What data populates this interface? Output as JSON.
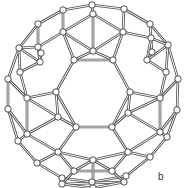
{
  "figure": {
    "label": "b",
    "colors": {
      "bond": "#4a4a4a",
      "atom_fill": "#ffffff",
      "atom_stroke": "#3a3a3a"
    }
  },
  "nodes": [
    [
      92,
      5
    ],
    [
      124,
      9
    ],
    [
      150,
      24
    ],
    [
      168,
      45
    ],
    [
      178,
      79
    ],
    [
      177,
      110
    ],
    [
      167,
      137
    ],
    [
      150,
      157
    ],
    [
      126,
      176
    ],
    [
      92,
      182
    ],
    [
      62,
      178
    ],
    [
      37,
      163
    ],
    [
      18,
      141
    ],
    [
      8,
      109
    ],
    [
      8,
      79
    ],
    [
      19,
      48
    ],
    [
      38,
      24
    ],
    [
      63,
      10
    ],
    [
      93,
      14
    ],
    [
      63,
      32
    ],
    [
      123,
      32
    ],
    [
      38,
      47
    ],
    [
      151,
      38
    ],
    [
      20,
      72
    ],
    [
      166,
      72
    ],
    [
      74,
      60
    ],
    [
      113,
      60
    ],
    [
      93,
      51
    ],
    [
      40,
      62
    ],
    [
      147,
      60
    ],
    [
      152,
      52
    ],
    [
      41,
      53
    ],
    [
      56,
      92
    ],
    [
      130,
      92
    ],
    [
      27,
      98
    ],
    [
      160,
      98
    ],
    [
      76,
      127
    ],
    [
      112,
      127
    ],
    [
      58,
      117
    ],
    [
      128,
      113
    ],
    [
      27,
      134
    ],
    [
      160,
      132
    ],
    [
      58,
      152
    ],
    [
      128,
      152
    ],
    [
      74,
      171
    ],
    [
      112,
      171
    ],
    [
      93,
      160
    ],
    [
      62,
      184
    ],
    [
      124,
      182
    ],
    [
      93,
      188
    ]
  ],
  "edges": [
    [
      0,
      1
    ],
    [
      1,
      2
    ],
    [
      2,
      3
    ],
    [
      3,
      4
    ],
    [
      4,
      5
    ],
    [
      5,
      6
    ],
    [
      6,
      7
    ],
    [
      7,
      8
    ],
    [
      8,
      9
    ],
    [
      9,
      10
    ],
    [
      10,
      11
    ],
    [
      11,
      12
    ],
    [
      12,
      13
    ],
    [
      13,
      14
    ],
    [
      14,
      15
    ],
    [
      15,
      16
    ],
    [
      16,
      17
    ],
    [
      17,
      0
    ],
    [
      0,
      18
    ],
    [
      18,
      19
    ],
    [
      18,
      20
    ],
    [
      19,
      17
    ],
    [
      20,
      1
    ],
    [
      19,
      25
    ],
    [
      20,
      26
    ],
    [
      25,
      26
    ],
    [
      18,
      27
    ],
    [
      27,
      25
    ],
    [
      27,
      26
    ],
    [
      19,
      27
    ],
    [
      20,
      27
    ],
    [
      16,
      21
    ],
    [
      21,
      15
    ],
    [
      21,
      31
    ],
    [
      31,
      28
    ],
    [
      28,
      21
    ],
    [
      15,
      28
    ],
    [
      19,
      21
    ],
    [
      28,
      23
    ],
    [
      23,
      15
    ],
    [
      2,
      22
    ],
    [
      22,
      3
    ],
    [
      22,
      30
    ],
    [
      30,
      29
    ],
    [
      29,
      22
    ],
    [
      3,
      29
    ],
    [
      20,
      22
    ],
    [
      29,
      24
    ],
    [
      24,
      3
    ],
    [
      25,
      32
    ],
    [
      26,
      33
    ],
    [
      32,
      36
    ],
    [
      36,
      37
    ],
    [
      37,
      33
    ],
    [
      32,
      34
    ],
    [
      32,
      38
    ],
    [
      34,
      38
    ],
    [
      38,
      36
    ],
    [
      34,
      40
    ],
    [
      40,
      38
    ],
    [
      23,
      34
    ],
    [
      14,
      34
    ],
    [
      13,
      40
    ],
    [
      33,
      35
    ],
    [
      33,
      39
    ],
    [
      35,
      39
    ],
    [
      39,
      37
    ],
    [
      35,
      41
    ],
    [
      41,
      39
    ],
    [
      24,
      35
    ],
    [
      4,
      35
    ],
    [
      5,
      41
    ],
    [
      36,
      42
    ],
    [
      42,
      40
    ],
    [
      42,
      46
    ],
    [
      46,
      44
    ],
    [
      44,
      42
    ],
    [
      37,
      43
    ],
    [
      43,
      41
    ],
    [
      43,
      46
    ],
    [
      46,
      45
    ],
    [
      45,
      43
    ],
    [
      44,
      45
    ],
    [
      44,
      47
    ],
    [
      45,
      48
    ],
    [
      47,
      48
    ],
    [
      47,
      10
    ],
    [
      48,
      8
    ],
    [
      42,
      11
    ],
    [
      43,
      7
    ],
    [
      12,
      40
    ],
    [
      6,
      41
    ],
    [
      46,
      49
    ],
    [
      47,
      49
    ],
    [
      48,
      49
    ]
  ]
}
